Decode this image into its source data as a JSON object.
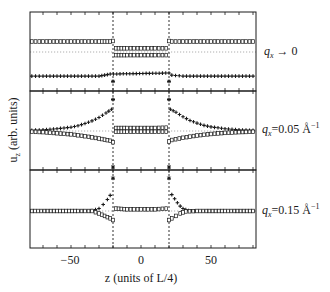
{
  "chart_data": {
    "type": "scatter",
    "title": "",
    "xlabel": "z (units of L/4)",
    "ylabel": "u_z (arb. units)",
    "xlim": [
      -80,
      82
    ],
    "xticks": [
      -50,
      0,
      50
    ],
    "x_minor_tick_step": 10,
    "interfaces_z": [
      -20,
      20
    ],
    "grid": false,
    "legend": "none (panel labels at right)",
    "panels": [
      {
        "label": "q_x → 0",
        "label_parts": {
          "q": "q",
          "sub": "x",
          "rest": " → 0",
          "sup": ""
        },
        "reference_level": 0,
        "series": [
          {
            "name": "open squares (u_z, component 1)",
            "marker": "square-open",
            "points": [
              [
                -78,
                1
              ],
              [
                -70,
                1
              ],
              [
                -60,
                1
              ],
              [
                -50,
                1
              ],
              [
                -40,
                1
              ],
              [
                -30,
                1
              ],
              [
                -22,
                1
              ],
              [
                -20,
                1.05
              ],
              [
                -18,
                0.35
              ],
              [
                -10,
                0.35
              ],
              [
                0,
                0.35
              ],
              [
                10,
                0.35
              ],
              [
                18,
                0.35
              ],
              [
                20,
                1.05
              ],
              [
                22,
                1
              ],
              [
                30,
                1
              ],
              [
                40,
                1
              ],
              [
                50,
                1
              ],
              [
                60,
                1
              ],
              [
                70,
                1
              ],
              [
                80,
                1
              ]
            ]
          },
          {
            "name": "open squares (u_z, component 2, center)",
            "marker": "square-open",
            "points": [
              [
                -18,
                -0.3
              ],
              [
                -10,
                -0.3
              ],
              [
                0,
                -0.3
              ],
              [
                10,
                -0.3
              ],
              [
                18,
                -0.3
              ]
            ]
          },
          {
            "name": "plus (u_z, component 3)",
            "marker": "plus",
            "points": [
              [
                -78,
                -2.3
              ],
              [
                -70,
                -2.3
              ],
              [
                -60,
                -2.3
              ],
              [
                -50,
                -2.3
              ],
              [
                -40,
                -2.3
              ],
              [
                -30,
                -2.3
              ],
              [
                -22,
                -2.1
              ],
              [
                20,
                -2.0
              ],
              [
                22,
                -2.2
              ],
              [
                30,
                -2.3
              ],
              [
                40,
                -2.3
              ],
              [
                50,
                -2.3
              ],
              [
                60,
                -2.3
              ],
              [
                70,
                -2.3
              ],
              [
                80,
                -2.3
              ]
            ]
          },
          {
            "name": "interface stars",
            "marker": "star",
            "points": [
              [
                -20,
                -2.8
              ],
              [
                20,
                -2.8
              ]
            ]
          }
        ]
      },
      {
        "label": "q_x=0.05 Å^-1",
        "label_parts": {
          "q": "q",
          "sub": "x",
          "rest": "=0.05 Å",
          "sup": "−1"
        },
        "reference_level": 0,
        "series": [
          {
            "name": "plus (left, rising)",
            "marker": "plus",
            "points": [
              [
                -78,
                0.1
              ],
              [
                -70,
                0.15
              ],
              [
                -60,
                0.3
              ],
              [
                -50,
                0.5
              ],
              [
                -45,
                0.7
              ],
              [
                -40,
                1.0
              ],
              [
                -35,
                1.35
              ],
              [
                -30,
                1.8
              ],
              [
                -25,
                2.4
              ],
              [
                -21,
                2.9
              ]
            ]
          },
          {
            "name": "open squares (left, falling)",
            "marker": "square-open",
            "points": [
              [
                -78,
                -0.1
              ],
              [
                -70,
                -0.15
              ],
              [
                -60,
                -0.3
              ],
              [
                -50,
                -0.45
              ],
              [
                -40,
                -0.7
              ],
              [
                -30,
                -1.0
              ],
              [
                -22,
                -1.3
              ],
              [
                -20,
                -1.5
              ]
            ]
          },
          {
            "name": "open squares (center, upper)",
            "marker": "square-open",
            "points": [
              [
                -18,
                0.4
              ],
              [
                -10,
                0.4
              ],
              [
                0,
                0.4
              ],
              [
                10,
                0.4
              ],
              [
                18,
                0.45
              ]
            ]
          },
          {
            "name": "open squares (center, lower)",
            "marker": "square-open",
            "points": [
              [
                -18,
                -0.1
              ],
              [
                -10,
                -0.1
              ],
              [
                0,
                -0.1
              ],
              [
                10,
                -0.1
              ],
              [
                18,
                -0.1
              ]
            ]
          },
          {
            "name": "plus (right, decaying)",
            "marker": "plus",
            "points": [
              [
                21,
                2.9
              ],
              [
                25,
                2.5
              ],
              [
                30,
                1.9
              ],
              [
                35,
                1.4
              ],
              [
                40,
                1.05
              ],
              [
                45,
                0.75
              ],
              [
                50,
                0.55
              ],
              [
                60,
                0.3
              ],
              [
                70,
                0.15
              ],
              [
                80,
                0.08
              ]
            ]
          },
          {
            "name": "open squares (right, rising)",
            "marker": "square-open",
            "points": [
              [
                20,
                -1.4
              ],
              [
                22,
                -1.2
              ],
              [
                30,
                -0.9
              ],
              [
                40,
                -0.6
              ],
              [
                50,
                -0.4
              ],
              [
                60,
                -0.25
              ],
              [
                70,
                -0.15
              ],
              [
                80,
                -0.1
              ]
            ]
          },
          {
            "name": "interface stars",
            "marker": "star",
            "points": [
              [
                -20,
                4.2
              ],
              [
                20,
                4.2
              ],
              [
                -20,
                -5.0
              ],
              [
                20,
                -5.0
              ]
            ]
          }
        ]
      },
      {
        "label": "q_x=0.15 Å^-1",
        "label_parts": {
          "q": "q",
          "sub": "x",
          "rest": "=0.15 Å",
          "sup": "−1"
        },
        "reference_level": 0,
        "series": [
          {
            "name": "plus (left)",
            "marker": "plus",
            "points": [
              [
                -78,
                0
              ],
              [
                -60,
                0
              ],
              [
                -45,
                0
              ],
              [
                -35,
                0.05
              ],
              [
                -30,
                0.3
              ],
              [
                -27,
                0.8
              ],
              [
                -24,
                1.4
              ],
              [
                -22,
                1.9
              ]
            ]
          },
          {
            "name": "open squares (left)",
            "marker": "square-open",
            "points": [
              [
                -78,
                0
              ],
              [
                -60,
                0
              ],
              [
                -45,
                0
              ],
              [
                -35,
                0
              ],
              [
                -30,
                -0.3
              ],
              [
                -26,
                -0.6
              ],
              [
                -22,
                -0.9
              ],
              [
                -20,
                -1.1
              ]
            ]
          },
          {
            "name": "open squares (center)",
            "marker": "square-open",
            "points": [
              [
                -18,
                0.3
              ],
              [
                -10,
                0.2
              ],
              [
                0,
                0.2
              ],
              [
                10,
                0.2
              ],
              [
                18,
                0.3
              ]
            ]
          },
          {
            "name": "plus (right)",
            "marker": "plus",
            "points": [
              [
                22,
                2.0
              ],
              [
                24,
                1.5
              ],
              [
                26,
                1.0
              ],
              [
                28,
                0.6
              ],
              [
                30,
                0.3
              ],
              [
                34,
                0.05
              ],
              [
                40,
                0
              ],
              [
                60,
                0
              ],
              [
                80,
                0
              ]
            ]
          },
          {
            "name": "open squares (right)",
            "marker": "square-open",
            "points": [
              [
                20,
                -1.1
              ],
              [
                22,
                -0.9
              ],
              [
                25,
                -0.6
              ],
              [
                28,
                -0.3
              ],
              [
                32,
                -0.05
              ],
              [
                40,
                0
              ],
              [
                60,
                0
              ],
              [
                80,
                0
              ]
            ]
          },
          {
            "name": "interface stars",
            "marker": "star",
            "points": [
              [
                -20,
                4.0
              ],
              [
                20,
                4.0
              ]
            ]
          }
        ]
      }
    ]
  },
  "axes": {
    "xtick_labels": [
      "−50",
      "0",
      "50"
    ],
    "xlabel": "z (units of L/4)",
    "ylabel": "u",
    "ylabel_sub": "z",
    "ylabel_rest": " (arb. units)"
  },
  "colors": {
    "ink": "#1a1a1a",
    "reference_line": "#9a9a9a",
    "background": "#ffffff"
  }
}
